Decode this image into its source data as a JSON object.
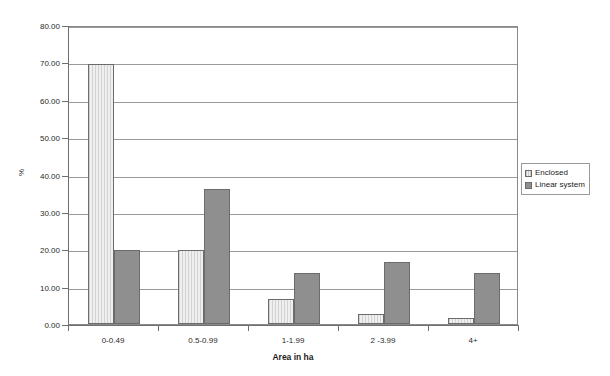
{
  "chart_data": {
    "type": "bar",
    "title": "",
    "xlabel": "Area in ha",
    "ylabel": "%",
    "categories": [
      "0-0.49",
      "0.5-0.99",
      "1-1.99",
      "2 -3.99",
      "4+"
    ],
    "series": [
      {
        "name": "Enclosed",
        "color": "#e3e3e3",
        "values": [
          69.5,
          19.8,
          6.7,
          2.7,
          1.6
        ]
      },
      {
        "name": "Linear system",
        "color": "#8f8f8f",
        "values": [
          19.8,
          36.1,
          13.7,
          16.6,
          13.7
        ]
      }
    ],
    "ylim": [
      0,
      80
    ],
    "ytick_step": 10,
    "ytick_labels": [
      "0.00",
      "10.00",
      "20.00",
      "30.00",
      "40.00",
      "50.00",
      "60.00",
      "70.00",
      "80.00"
    ],
    "ytick_values": [
      0,
      10,
      20,
      30,
      40,
      50,
      60,
      70,
      80
    ],
    "grid": true,
    "grid_axis": "y",
    "legend_position": "right"
  },
  "legend": {
    "items": [
      {
        "label": "Enclosed"
      },
      {
        "label": "Linear system"
      }
    ]
  },
  "axes": {
    "x_title": "Area in ha",
    "y_title": "%"
  }
}
